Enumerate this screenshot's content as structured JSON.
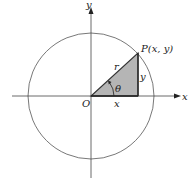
{
  "diagram": {
    "labels": {
      "y_axis": "y",
      "x_axis": "x",
      "origin": "O",
      "point": "P(x, y)",
      "radius": "r",
      "angle": "θ",
      "horizontal_leg": "x",
      "vertical_leg": "y"
    },
    "colors": {
      "stroke": "#333333",
      "triangle_fill": "#b5b5b5",
      "background": "#ffffff"
    }
  }
}
